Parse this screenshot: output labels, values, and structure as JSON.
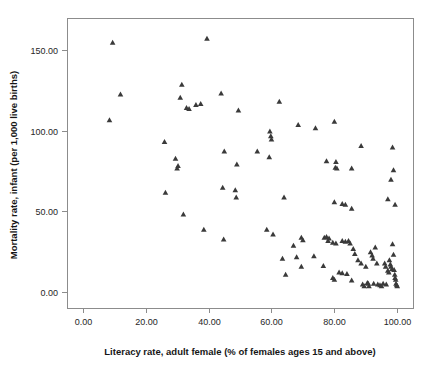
{
  "chart_data": {
    "type": "scatter",
    "title": "",
    "xlabel": "Literacy rate, adult female (% of females ages 15 and above)",
    "ylabel": "Mortality rate, infant (per 1,000 live births)",
    "xlim": [
      -5,
      105
    ],
    "ylim": [
      -10,
      170
    ],
    "grid": false,
    "legend": "none",
    "marker": "triangle",
    "marker_color": "#3a3a3a",
    "xticks": [
      0,
      20,
      40,
      60,
      80,
      100
    ],
    "xtick_labels": [
      "0.00",
      "20.00",
      "40.00",
      "60.00",
      "80.00",
      "100.00"
    ],
    "yticks": [
      0,
      50,
      100,
      150
    ],
    "ytick_labels": [
      "0.00",
      "50.00",
      "100.00",
      "150.00"
    ],
    "series": [
      {
        "name": "Countries",
        "points": [
          [
            9.5,
            154.5
          ],
          [
            39.5,
            157.0
          ],
          [
            12.0,
            122.5
          ],
          [
            8.5,
            106.5
          ],
          [
            31.5,
            128.5
          ],
          [
            31.0,
            120.5
          ],
          [
            33.0,
            114.0
          ],
          [
            33.8,
            113.5
          ],
          [
            36.0,
            116.0
          ],
          [
            37.5,
            116.5
          ],
          [
            44.0,
            123.0
          ],
          [
            49.5,
            112.5
          ],
          [
            62.5,
            118.0
          ],
          [
            26.0,
            93.0
          ],
          [
            29.5,
            82.5
          ],
          [
            30.3,
            78.0
          ],
          [
            30.0,
            76.5
          ],
          [
            45.0,
            87.0
          ],
          [
            49.0,
            79.0
          ],
          [
            55.5,
            87.0
          ],
          [
            59.5,
            99.5
          ],
          [
            59.8,
            96.5
          ],
          [
            60.0,
            94.5
          ],
          [
            59.3,
            83.5
          ],
          [
            68.5,
            103.5
          ],
          [
            74.0,
            101.5
          ],
          [
            80.0,
            105.5
          ],
          [
            88.5,
            90.5
          ],
          [
            98.5,
            89.5
          ],
          [
            77.5,
            81.0
          ],
          [
            80.5,
            80.5
          ],
          [
            80.3,
            77.0
          ],
          [
            80.8,
            76.5
          ],
          [
            85.5,
            76.5
          ],
          [
            98.8,
            75.5
          ],
          [
            98.0,
            69.5
          ],
          [
            26.3,
            61.5
          ],
          [
            44.5,
            64.5
          ],
          [
            48.5,
            63.0
          ],
          [
            48.8,
            58.5
          ],
          [
            64.0,
            58.5
          ],
          [
            80.0,
            55.5
          ],
          [
            82.5,
            54.5
          ],
          [
            83.5,
            54.0
          ],
          [
            85.5,
            51.5
          ],
          [
            97.0,
            57.5
          ],
          [
            99.3,
            54.0
          ],
          [
            32.0,
            48.0
          ],
          [
            38.5,
            38.5
          ],
          [
            44.8,
            32.5
          ],
          [
            58.5,
            38.5
          ],
          [
            60.5,
            35.5
          ],
          [
            67.0,
            28.5
          ],
          [
            69.5,
            33.5
          ],
          [
            70.0,
            32.0
          ],
          [
            63.5,
            20.5
          ],
          [
            68.0,
            21.5
          ],
          [
            69.5,
            15.5
          ],
          [
            73.5,
            22.0
          ],
          [
            76.8,
            33.5
          ],
          [
            77.5,
            34.0
          ],
          [
            78.3,
            33.0
          ],
          [
            78.0,
            31.5
          ],
          [
            79.5,
            30.5
          ],
          [
            80.5,
            30.0
          ],
          [
            82.5,
            31.5
          ],
          [
            83.5,
            31.0
          ],
          [
            84.5,
            31.5
          ],
          [
            85.0,
            30.0
          ],
          [
            86.0,
            26.5
          ],
          [
            86.5,
            23.5
          ],
          [
            64.5,
            10.5
          ],
          [
            76.5,
            16.0
          ],
          [
            79.5,
            8.5
          ],
          [
            80.0,
            7.5
          ],
          [
            81.5,
            12.0
          ],
          [
            82.5,
            11.5
          ],
          [
            84.0,
            11.0
          ],
          [
            85.5,
            7.0
          ],
          [
            87.5,
            19.5
          ],
          [
            88.5,
            17.5
          ],
          [
            89.5,
            3.5
          ],
          [
            90.0,
            15.5
          ],
          [
            90.5,
            5.5
          ],
          [
            90.8,
            5.0
          ],
          [
            91.5,
            24.5
          ],
          [
            92.0,
            22.5
          ],
          [
            92.3,
            20.5
          ],
          [
            92.5,
            5.0
          ],
          [
            93.0,
            27.5
          ],
          [
            93.5,
            17.5
          ],
          [
            93.8,
            4.5
          ],
          [
            94.5,
            4.0
          ],
          [
            95.5,
            5.0
          ],
          [
            96.0,
            17.5
          ],
          [
            96.3,
            15.5
          ],
          [
            96.5,
            4.5
          ],
          [
            97.0,
            13.0
          ],
          [
            97.3,
            12.0
          ],
          [
            97.5,
            19.5
          ],
          [
            97.8,
            17.0
          ],
          [
            98.0,
            15.5
          ],
          [
            98.3,
            14.0
          ],
          [
            98.5,
            29.5
          ],
          [
            98.8,
            23.0
          ],
          [
            99.0,
            13.5
          ],
          [
            99.2,
            10.5
          ],
          [
            99.3,
            8.5
          ],
          [
            99.5,
            7.5
          ],
          [
            99.6,
            5.0
          ],
          [
            99.8,
            4.0
          ],
          [
            100.0,
            3.5
          ],
          [
            95.0,
            3.5
          ],
          [
            91.0,
            3.5
          ],
          [
            89.0,
            4.5
          ]
        ]
      }
    ]
  }
}
